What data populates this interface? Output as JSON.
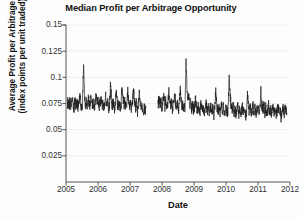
{
  "chart_data": {
    "type": "line",
    "title": "Median Profit per Arbitrage Opportunity",
    "xlabel": "Date",
    "ylabel_line1": "Average Profit per Arbitrage",
    "ylabel_line2": "(index points per unit traded)",
    "xlim": [
      2005.0,
      2012.0
    ],
    "ylim": [
      0.0,
      0.15
    ],
    "xticks": [
      "2005",
      "2006",
      "2007",
      "2008",
      "2009",
      "2010",
      "2011",
      "2012"
    ],
    "xtick_values": [
      2005,
      2006,
      2007,
      2008,
      2009,
      2010,
      2011,
      2012
    ],
    "yticks": [
      "0.025",
      "0.05",
      "0.075",
      "0.1",
      "0.125",
      "0.15"
    ],
    "ytick_values": [
      0.025,
      0.05,
      0.075,
      0.1,
      0.125,
      0.15
    ],
    "grid": "horizontal-faint",
    "legend": "none",
    "line_color": "#1c1c1c",
    "background_color": "#fdfdfd",
    "series": [
      {
        "name": "Median profit per arbitrage opportunity",
        "note": "Dense daily series, noisy, centred near 0.075 index points per unit traded, with a data gap in mid-2007 and a pronounced spike in late 2008.",
        "x": [
          2005.04,
          2005.07,
          2005.1,
          2005.13,
          2005.16,
          2005.19,
          2005.22,
          2005.25,
          2005.28,
          2005.31,
          2005.34,
          2005.37,
          2005.4,
          2005.43,
          2005.46,
          2005.49,
          2005.52,
          2005.55,
          2005.58,
          2005.61,
          2005.64,
          2005.67,
          2005.7,
          2005.73,
          2005.76,
          2005.79,
          2005.82,
          2005.85,
          2005.88,
          2005.91,
          2005.94,
          2005.97,
          2006.0,
          2006.03,
          2006.06,
          2006.09,
          2006.12,
          2006.15,
          2006.18,
          2006.21,
          2006.24,
          2006.27,
          2006.3,
          2006.33,
          2006.36,
          2006.39,
          2006.42,
          2006.45,
          2006.48,
          2006.51,
          2006.54,
          2006.57,
          2006.6,
          2006.63,
          2006.66,
          2006.69,
          2006.72,
          2006.75,
          2006.78,
          2006.81,
          2006.84,
          2006.87,
          2006.9,
          2006.93,
          2006.96,
          2006.99,
          2007.02,
          2007.05,
          2007.08,
          2007.11,
          2007.14,
          2007.17,
          2007.2,
          2007.23,
          2007.26,
          2007.29,
          2007.32,
          2007.35,
          2007.38,
          2007.41,
          2007.44,
          2007.47,
          2007.5,
          2007.88,
          2007.91,
          2007.94,
          2007.97,
          2008.0,
          2008.03,
          2008.06,
          2008.09,
          2008.12,
          2008.15,
          2008.18,
          2008.21,
          2008.24,
          2008.27,
          2008.3,
          2008.33,
          2008.36,
          2008.39,
          2008.42,
          2008.45,
          2008.48,
          2008.51,
          2008.54,
          2008.57,
          2008.6,
          2008.63,
          2008.66,
          2008.69,
          2008.72,
          2008.75,
          2008.78,
          2008.81,
          2008.84,
          2008.87,
          2008.9,
          2008.93,
          2008.96,
          2008.99,
          2009.02,
          2009.05,
          2009.08,
          2009.11,
          2009.14,
          2009.17,
          2009.2,
          2009.23,
          2009.26,
          2009.29,
          2009.32,
          2009.35,
          2009.38,
          2009.41,
          2009.44,
          2009.47,
          2009.5,
          2009.53,
          2009.56,
          2009.59,
          2009.62,
          2009.65,
          2009.68,
          2009.71,
          2009.74,
          2009.77,
          2009.8,
          2009.83,
          2009.86,
          2009.89,
          2009.92,
          2009.95,
          2009.98,
          2010.01,
          2010.04,
          2010.07,
          2010.1,
          2010.13,
          2010.16,
          2010.19,
          2010.22,
          2010.25,
          2010.28,
          2010.31,
          2010.34,
          2010.37,
          2010.4,
          2010.43,
          2010.46,
          2010.49,
          2010.52,
          2010.55,
          2010.58,
          2010.61,
          2010.64,
          2010.67,
          2010.7,
          2010.73,
          2010.76,
          2010.79,
          2010.82,
          2010.85,
          2010.88,
          2010.91,
          2010.94,
          2010.97,
          2011.0,
          2011.03,
          2011.06,
          2011.09,
          2011.12,
          2011.15,
          2011.18,
          2011.21,
          2011.24,
          2011.27,
          2011.3,
          2011.33,
          2011.36,
          2011.39,
          2011.42,
          2011.45,
          2011.48,
          2011.51,
          2011.54,
          2011.57,
          2011.6,
          2011.63,
          2011.66,
          2011.69,
          2011.72,
          2011.75,
          2011.78,
          2011.81,
          2011.84,
          2011.87,
          2011.9
        ],
        "y": [
          0.0745,
          0.0762,
          0.0731,
          0.0778,
          0.0718,
          0.0802,
          0.0744,
          0.0712,
          0.0791,
          0.0735,
          0.0769,
          0.0706,
          0.0758,
          0.0828,
          0.0742,
          0.0689,
          0.0774,
          0.1126,
          0.0796,
          0.0733,
          0.0761,
          0.0705,
          0.0787,
          0.0724,
          0.0756,
          0.0812,
          0.0718,
          0.0773,
          0.0699,
          0.0745,
          0.0833,
          0.0728,
          0.0769,
          0.0702,
          0.0751,
          0.0794,
          0.0716,
          0.0763,
          0.0688,
          0.0742,
          0.0808,
          0.0729,
          0.0777,
          0.0695,
          0.0748,
          0.0931,
          0.0784,
          0.0721,
          0.0758,
          0.0691,
          0.0739,
          0.0871,
          0.0766,
          0.0713,
          0.0752,
          0.0684,
          0.0746,
          0.0899,
          0.0792,
          0.0726,
          0.0768,
          0.0703,
          0.0741,
          0.0856,
          0.0779,
          0.0717,
          0.0754,
          0.0686,
          0.0738,
          0.0883,
          0.0771,
          0.0709,
          0.0747,
          0.0662,
          0.0724,
          0.0846,
          0.0758,
          0.0698,
          0.0736,
          0.0641,
          0.0712,
          0.0689,
          0.0704,
          0.0748,
          0.0812,
          0.0733,
          0.0776,
          0.0702,
          0.0759,
          0.0836,
          0.0727,
          0.0768,
          0.0695,
          0.0741,
          0.0874,
          0.0783,
          0.0719,
          0.0756,
          0.0688,
          0.0744,
          0.0821,
          0.0772,
          0.0711,
          0.0749,
          0.0679,
          0.0731,
          0.0863,
          0.0765,
          0.0706,
          0.0743,
          0.0673,
          0.0726,
          0.1148,
          0.0892,
          0.0781,
          0.0822,
          0.0738,
          0.0769,
          0.0701,
          0.0752,
          0.0687,
          0.0729,
          0.0775,
          0.0706,
          0.0684,
          0.0721,
          0.0658,
          0.0702,
          0.0749,
          0.0673,
          0.0716,
          0.0651,
          0.0694,
          0.0738,
          0.0667,
          0.0709,
          0.0645,
          0.0688,
          0.0731,
          0.0662,
          0.0705,
          0.0639,
          0.0682,
          0.0858,
          0.0726,
          0.0671,
          0.0713,
          0.0648,
          0.0691,
          0.0734,
          0.0664,
          0.0707,
          0.0642,
          0.0685,
          0.0728,
          0.0659,
          0.0702,
          0.1052,
          0.0813,
          0.0726,
          0.0688,
          0.0731,
          0.0656,
          0.0699,
          0.0636,
          0.0679,
          0.0722,
          0.0653,
          0.0696,
          0.0631,
          0.0674,
          0.0717,
          0.0649,
          0.0692,
          0.0628,
          0.0671,
          0.0841,
          0.0719,
          0.0663,
          0.0706,
          0.0641,
          0.0684,
          0.0727,
          0.0658,
          0.0701,
          0.0637,
          0.0679,
          0.0722,
          0.0652,
          0.0695,
          0.0874,
          0.0746,
          0.0689,
          0.0732,
          0.0661,
          0.0704,
          0.0639,
          0.0682,
          0.0725,
          0.0656,
          0.0699,
          0.0634,
          0.0677,
          0.0719,
          0.0651,
          0.0693,
          0.0629,
          0.0672,
          0.0715,
          0.0647,
          0.0689,
          0.0624,
          0.0667,
          0.0709,
          0.0643,
          0.0686,
          0.0671,
          0.0658
        ]
      }
    ]
  }
}
